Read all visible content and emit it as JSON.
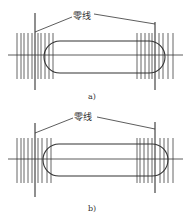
{
  "figure": {
    "panels": [
      {
        "id": "a",
        "caption": "a)",
        "zero_line_label": "零线",
        "label_pos": [
          73,
          11
        ],
        "caption_pos": [
          88,
          92
        ],
        "axis": {
          "x1": 8,
          "x2": 183,
          "y": 55
        },
        "zero_lines": [
          {
            "x": 35,
            "y1": 13,
            "y2": 90
          },
          {
            "x": 155,
            "y1": 22,
            "y2": 90
          }
        ],
        "leaders": [
          {
            "x1": 72,
            "y1": 17,
            "x2": 35,
            "y2": 32
          },
          {
            "x1": 94,
            "y1": 14,
            "x2": 155,
            "y2": 24
          }
        ],
        "slot": {
          "x": 44,
          "y": 41,
          "w": 121,
          "h": 32,
          "r": 16
        },
        "hatch": {
          "y1": 33,
          "y2": 79,
          "xs": [
            17,
            21,
            24,
            28,
            32,
            38,
            41,
            45,
            49,
            53,
            137,
            141,
            145,
            149,
            152,
            159,
            163,
            168,
            173
          ]
        }
      },
      {
        "id": "b",
        "caption": "b)",
        "zero_line_label": "零线",
        "label_pos": [
          74,
          112
        ],
        "caption_pos": [
          88,
          204
        ],
        "axis": {
          "x1": 8,
          "x2": 183,
          "y": 159
        },
        "zero_lines": [
          {
            "x": 35,
            "y1": 123,
            "y2": 197
          },
          {
            "x": 155,
            "y1": 122,
            "y2": 193
          }
        ],
        "leaders": [
          {
            "x1": 73,
            "y1": 118,
            "x2": 35,
            "y2": 133
          },
          {
            "x1": 97,
            "y1": 117,
            "x2": 155,
            "y2": 129
          }
        ],
        "slot": {
          "x": 43,
          "y": 144,
          "w": 125,
          "h": 32,
          "r": 16
        },
        "hatch": {
          "y1": 138,
          "y2": 183,
          "xs": [
            17,
            21,
            24,
            28,
            32,
            38,
            42,
            47,
            51,
            137,
            140,
            144,
            148,
            152,
            160,
            164,
            168,
            173
          ]
        }
      }
    ],
    "colors": {
      "line": "#333333",
      "hatch": "#555555",
      "bg": "#ffffff"
    }
  }
}
